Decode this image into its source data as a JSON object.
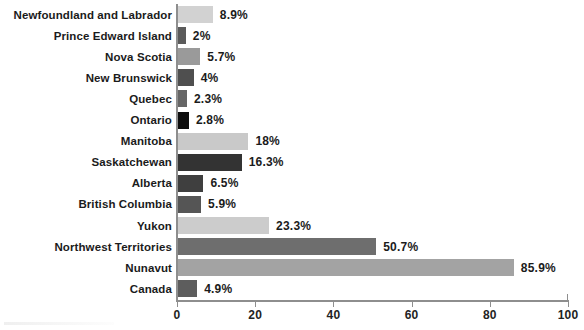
{
  "chart_data": {
    "type": "bar",
    "orientation": "horizontal",
    "title": "",
    "subtitle": "",
    "xlabel": "",
    "ylabel": "",
    "xlim": [
      0,
      100
    ],
    "xticks": [
      "0",
      "20",
      "40",
      "60",
      "80",
      "100"
    ],
    "grid": false,
    "legend": "none",
    "value_suffix": "%",
    "categories": [
      "Newfoundland and Labrador",
      "Prince Edward Island",
      "Nova Scotia",
      "New Brunswick",
      "Quebec",
      "Ontario",
      "Manitoba",
      "Saskatchewan",
      "Alberta",
      "British Columbia",
      "Yukon",
      "Northwest Territories",
      "Nunavut",
      "Canada"
    ],
    "values": [
      8.9,
      2,
      5.7,
      4,
      2.3,
      2.8,
      18,
      16.3,
      6.5,
      5.9,
      23.3,
      50.7,
      85.9,
      4.9
    ],
    "value_labels": [
      "8.9%",
      "2%",
      "5.7%",
      "4%",
      "2.3%",
      "2.8%",
      "18%",
      "16.3%",
      "6.5%",
      "5.9%",
      "23.3%",
      "50.7%",
      "85.9%",
      "4.9%"
    ],
    "bar_colors": [
      "#d2d2d2",
      "#5b5b5b",
      "#9a9a9a",
      "#4f4f4f",
      "#666666",
      "#0d0d0d",
      "#c9c9c9",
      "#333333",
      "#3f3f3f",
      "#555555",
      "#cccccc",
      "#6e6e6e",
      "#a3a3a3",
      "#5d5d5d"
    ]
  },
  "style": {
    "axis_color": "#8e8e8e",
    "text_color": "#1b1b1b",
    "background": "#ffffff"
  }
}
